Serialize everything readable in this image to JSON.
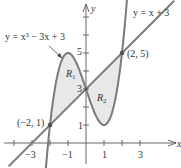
{
  "chart_data": {
    "type": "line",
    "title": "",
    "xlabel": "x",
    "ylabel": "y",
    "xlim": [
      -4.7,
      5.2
    ],
    "ylim": [
      -1.3,
      7.9
    ],
    "x_ticks": [
      -4,
      -3,
      -2,
      -1,
      0,
      1,
      2,
      3
    ],
    "x_tick_labels": [
      "-3",
      "-1",
      "1",
      "3"
    ],
    "y_ticks": [
      1,
      2,
      3,
      4,
      5,
      6,
      7
    ],
    "y_tick_labels": [
      "1",
      "3",
      "5"
    ],
    "grid": false,
    "series": [
      {
        "name": "y = x^3 - 3x + 3",
        "function": "x^3 - 3x + 3",
        "domain": [
          -2.25,
          2.35
        ]
      },
      {
        "name": "y = x + 3",
        "function": "x + 3",
        "domain": [
          -4.3,
          4.9
        ]
      }
    ],
    "points": [
      {
        "label": "(-2, 1)",
        "x": -2,
        "y": 1
      },
      {
        "label": "(2, 5)",
        "x": 2,
        "y": 5
      }
    ],
    "regions": [
      {
        "label": "R1",
        "between": [
          -2,
          0
        ]
      },
      {
        "label": "R2",
        "between": [
          0,
          2
        ]
      }
    ],
    "annotations": {
      "cubic_label": "y = x³ − 3x + 3",
      "line_label": "y = x + 3",
      "point_a": "(−2, 1)",
      "point_b": "(2, 5)",
      "r1": "R",
      "r1_sub": "1",
      "r2": "R",
      "r2_sub": "2",
      "y_axis": "y",
      "x_axis": "x",
      "tick_m3": "−3",
      "tick_m1": "−1",
      "tick_1": "1",
      "tick_3": "3",
      "ytick_1": "1",
      "ytick_3": "3",
      "ytick_5": "5"
    },
    "colors": {
      "curve": "#7a7a7a",
      "fill": "#e8e8e8",
      "axis": "#666666",
      "point": "#555555"
    }
  }
}
